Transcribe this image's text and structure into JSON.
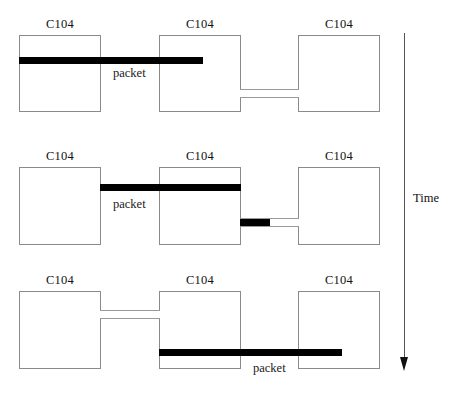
{
  "diagram": {
    "node_label": "C104",
    "packet_label": "packet",
    "time_axis_label": "Time",
    "colors": {
      "packet": "#000000",
      "box_border": "#8a8a8a",
      "cable": "#9a9a9a",
      "axis": "#555555",
      "background": "#ffffff",
      "text": "#111111"
    },
    "rows": [
      {
        "id": "row-1",
        "nodes": [
          {
            "id": "row1-node-1",
            "label": "C104"
          },
          {
            "id": "row1-node-2",
            "label": "C104"
          },
          {
            "id": "row1-node-3",
            "label": "C104"
          }
        ],
        "packet": {
          "label": "packet",
          "from": "node-1",
          "to": "node-2"
        },
        "link": {
          "from": "node-2",
          "to": "node-3",
          "state": "idle"
        }
      },
      {
        "id": "row-2",
        "nodes": [
          {
            "id": "row2-node-1",
            "label": "C104"
          },
          {
            "id": "row2-node-2",
            "label": "C104"
          },
          {
            "id": "row2-node-3",
            "label": "C104"
          }
        ],
        "packet": {
          "label": "packet",
          "from": "node-1",
          "to": "node-2"
        },
        "link": {
          "from": "node-2",
          "to": "node-3",
          "state": "transmitting"
        }
      },
      {
        "id": "row-3",
        "nodes": [
          {
            "id": "row3-node-1",
            "label": "C104"
          },
          {
            "id": "row3-node-2",
            "label": "C104"
          },
          {
            "id": "row3-node-3",
            "label": "C104"
          }
        ],
        "packet": {
          "label": "packet",
          "from": "node-2",
          "to": "node-3"
        },
        "link": {
          "from": "node-1",
          "to": "node-2",
          "state": "idle"
        }
      }
    ]
  }
}
